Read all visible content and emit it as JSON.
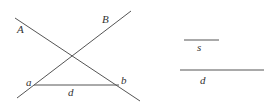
{
  "diagram": {
    "stroke_color": "#555555",
    "label_color": "#333333",
    "lines": [
      {
        "id": "line-A",
        "label": "A",
        "x1": 15,
        "y1": 18,
        "x2": 140,
        "y2": 101
      },
      {
        "id": "line-B",
        "label": "B",
        "x1": 17,
        "y1": 98,
        "x2": 131,
        "y2": 11
      },
      {
        "id": "base-ab",
        "label": "d",
        "x1": 34,
        "y1": 85,
        "x2": 119,
        "y2": 85
      },
      {
        "id": "segment-s",
        "label": "s",
        "x1": 184,
        "y1": 40,
        "x2": 219,
        "y2": 40
      },
      {
        "id": "segment-d",
        "label": "d",
        "x1": 180,
        "y1": 70,
        "x2": 264,
        "y2": 70
      }
    ],
    "labels": {
      "A": "A",
      "B": "B",
      "a": "a",
      "b": "b",
      "base_d": "d",
      "s": "s",
      "d": "d"
    }
  }
}
